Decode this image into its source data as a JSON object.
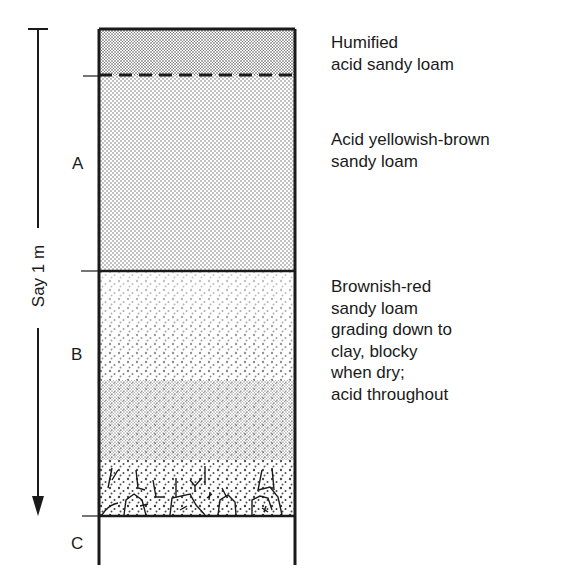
{
  "scale": {
    "label": "Say 1 m",
    "direction": "downward-arrow"
  },
  "horizons": [
    {
      "id": "A",
      "label": "A"
    },
    {
      "id": "B",
      "label": "B"
    },
    {
      "id": "C",
      "label": "C"
    }
  ],
  "layers": [
    {
      "name": "humified-layer",
      "lines": [
        "Humified",
        "acid sandy loam"
      ],
      "boundary_below": "dashed"
    },
    {
      "name": "yellowish-brown-layer",
      "lines": [
        "Acid yellowish-brown",
        "sandy loam"
      ],
      "boundary_below": "solid"
    },
    {
      "name": "brownish-red-layer",
      "lines": [
        "Brownish-red",
        "sandy loam",
        "grading down to",
        "clay, blocky",
        "when dry;",
        "acid throughout"
      ],
      "boundary_below": "solid"
    }
  ],
  "colors": {
    "ink": "#1a1a1a",
    "paper": "#ffffff",
    "humified_fill": "#c8c8c8",
    "a_fill": "#e2e2e2"
  }
}
